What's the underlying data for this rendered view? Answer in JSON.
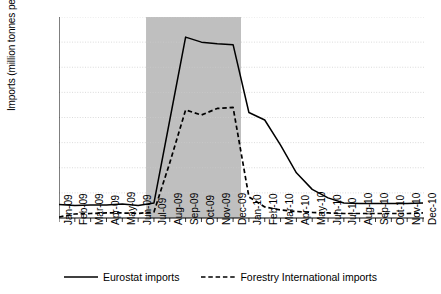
{
  "chart_data": {
    "type": "line",
    "title": "",
    "xlabel": "",
    "ylabel": "Imports (million tonnes per annum)",
    "ylim": [
      0.0,
      4.0
    ],
    "ytick_labels": [
      "0.0",
      "0.5",
      "1.0",
      "1.5",
      "2.0",
      "2.5",
      "3.0",
      "3.5",
      "4.0"
    ],
    "ytick_values": [
      0.0,
      0.5,
      1.0,
      1.5,
      2.0,
      2.5,
      3.0,
      3.5,
      4.0
    ],
    "grid": true,
    "grid_color": "#cccccc",
    "legend_position": "bottom",
    "categories": [
      "Jan-09",
      "Feb-09",
      "Mar-09",
      "Apr-09",
      "May-09",
      "Jun-09",
      "Jul-09",
      "Aug-09",
      "Sep-09",
      "Oct-09",
      "Nov-09",
      "Dec-09",
      "Jan-10",
      "Feb-10",
      "Mar-10",
      "Apr-10",
      "May-10",
      "Jun-10",
      "Jul-10",
      "Aug-10",
      "Sep-10",
      "Oct-10",
      "Nov-10",
      "Dec-10"
    ],
    "series": [
      {
        "name": "Eurostat imports",
        "style": "solid",
        "color": "#000000",
        "values": [
          0.27,
          0.25,
          0.26,
          0.26,
          0.28,
          0.25,
          0.3,
          1.95,
          3.6,
          3.5,
          3.47,
          3.45,
          2.1,
          1.95,
          1.45,
          0.9,
          0.57,
          0.4,
          0.3,
          0.29,
          0.29,
          0.29,
          0.29,
          0.3
        ]
      },
      {
        "name": "Forestry International imports",
        "style": "dashed",
        "color": "#000000",
        "values": [
          0.02,
          0.08,
          0.09,
          0.1,
          0.1,
          0.09,
          0.12,
          1.1,
          2.15,
          2.05,
          2.18,
          2.2,
          0.42,
          0.22,
          0.16,
          0.13,
          0.11,
          0.1,
          0.09,
          0.09,
          0.09,
          0.09,
          0.09,
          0.1
        ]
      }
    ],
    "shaded_region": {
      "color": "#bfbfbf",
      "start_category": "Jul-09",
      "end_category": "Dec-09"
    }
  },
  "legend": {
    "items": [
      {
        "label": "Eurostat imports",
        "style": "solid"
      },
      {
        "label": "Forestry International imports",
        "style": "dashed"
      }
    ]
  }
}
